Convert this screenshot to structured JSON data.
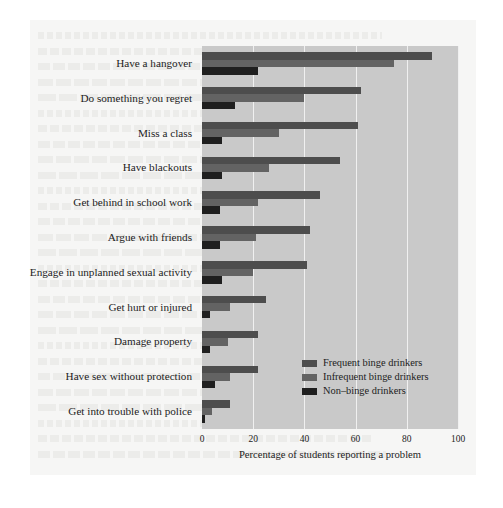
{
  "chart_data": {
    "type": "bar",
    "orientation": "horizontal",
    "title": "",
    "xlabel": "Percentage of students reporting a problem",
    "ylabel": "",
    "xlim": [
      0,
      100
    ],
    "xticks": [
      0,
      20,
      40,
      60,
      80,
      100
    ],
    "xtick_labels": [
      "0",
      "20",
      "40",
      "60",
      "80",
      "100"
    ],
    "grid": true,
    "legend_position": "lower right inside plot",
    "categories": [
      "Have a hangover",
      "Do something you regret",
      "Miss a class",
      "Have blackouts",
      "Get behind in school work",
      "Argue with friends",
      "Engage in unplanned sexual activity",
      "Get hurt or injured",
      "Damage property",
      "Have sex without protection",
      "Get into trouble with police"
    ],
    "series": [
      {
        "name": "Frequent binge drinkers",
        "color": "#4d4d4d",
        "values": [
          90,
          62,
          61,
          54,
          46,
          42,
          41,
          25,
          22,
          22,
          11
        ]
      },
      {
        "name": "Infrequent binge drinkers",
        "color": "#636363",
        "values": [
          75,
          40,
          30,
          26,
          22,
          21,
          20,
          11,
          10,
          11,
          4
        ]
      },
      {
        "name": "Non-binge drinkers",
        "color": "#1f1f1f",
        "values": [
          22,
          13,
          8,
          8,
          7,
          7,
          8,
          3,
          3,
          5,
          1
        ]
      }
    ]
  },
  "legend": {
    "items": [
      {
        "label": "Frequent binge drinkers",
        "color": "#4d4d4d"
      },
      {
        "label": "Infrequent binge drinkers",
        "color": "#636363"
      },
      {
        "label": "Non–binge drinkers",
        "color": "#1f1f1f"
      }
    ]
  },
  "axis": {
    "x_title": "Percentage of students reporting a problem",
    "x_tick_labels": [
      "0",
      "20",
      "40",
      "60",
      "80",
      "100"
    ]
  },
  "colors": {
    "plot_background": "#c9c9c9",
    "page_background": "#f3f3f2",
    "gridline": "#f0f0f0",
    "text": "#1c1c1c"
  }
}
